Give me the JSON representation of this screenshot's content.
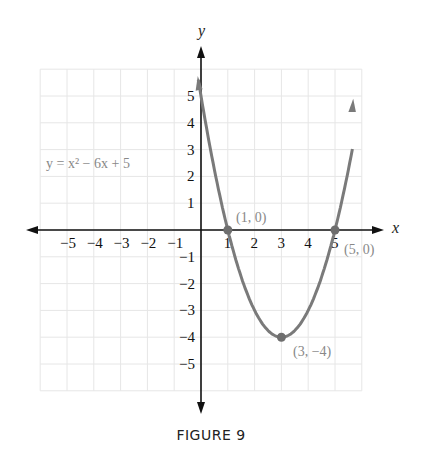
{
  "chart_data": {
    "type": "line",
    "title": "",
    "equation": "y = x² − 6x + 5",
    "xlabel": "x",
    "ylabel": "y",
    "xlim": [
      -6,
      6
    ],
    "ylim": [
      -6,
      6
    ],
    "grid": true,
    "x_ticks": [
      -5,
      -4,
      -3,
      -2,
      -1,
      1,
      2,
      3,
      4,
      5
    ],
    "y_ticks": [
      5,
      4,
      3,
      2,
      1,
      -1,
      -2,
      -3,
      -4,
      -5
    ],
    "series": [
      {
        "name": "y = x² − 6x + 5",
        "x": [
          0,
          0.5,
          1,
          1.5,
          2,
          2.5,
          3,
          3.5,
          4,
          4.5,
          5,
          5.5,
          6
        ],
        "y": [
          5,
          2.25,
          0,
          -1.75,
          -3,
          -3.75,
          -4,
          -3.75,
          -3,
          -1.75,
          0,
          2.25,
          5
        ]
      }
    ],
    "points": [
      {
        "x": 1,
        "y": 0,
        "label": "(1, 0)"
      },
      {
        "x": 5,
        "y": 0,
        "label": "(5, 0)"
      },
      {
        "x": 3,
        "y": -4,
        "label": "(3, −4)"
      }
    ],
    "colors": {
      "curve": "#7a7a7a",
      "axes": "#111111",
      "grid": "#e6e6e6",
      "annotation": "#888888"
    }
  },
  "labels": {
    "equation": "y = x² − 6x + 5",
    "x_axis": "x",
    "y_axis": "y",
    "p1": "(1, 0)",
    "p2": "(5, 0)",
    "p3": "(3, −4)"
  },
  "caption": "FIGURE 9"
}
